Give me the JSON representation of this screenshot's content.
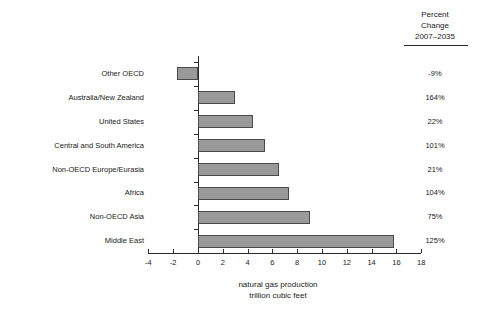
{
  "chart_data": {
    "type": "bar",
    "orientation": "horizontal",
    "title": "",
    "xlabel_lines": [
      "natural gas production",
      "trillion cubic feet"
    ],
    "ylabel": "",
    "xlim": [
      -4,
      18
    ],
    "xticks": [
      -4,
      -2,
      0,
      2,
      4,
      6,
      8,
      10,
      12,
      14,
      16,
      18
    ],
    "xtick_labels": [
      "-4",
      "-2",
      "0",
      "2",
      "4",
      "6",
      "8",
      "10",
      "12",
      "14",
      "16",
      "18"
    ],
    "grid": false,
    "legend": null,
    "bar_color": "#9a9a9a",
    "bar_edge_color": "#4a4a4a",
    "categories": [
      "Other OECD",
      "Australia/New Zealand",
      "United States",
      "Central and South America",
      "Non-OECD Europe/Eurasia",
      "Africa",
      "Non-OECD Asia",
      "Middle East"
    ],
    "values": [
      -1.7,
      3.0,
      4.4,
      5.4,
      6.5,
      7.3,
      9.0,
      15.8
    ],
    "annotations": {
      "percent_change_header_lines": [
        "Percent",
        "Change",
        "2007–2035"
      ],
      "percent_change": [
        "-9%",
        "164%",
        "22%",
        "101%",
        "21%",
        "104%",
        "75%",
        "125%"
      ]
    }
  }
}
